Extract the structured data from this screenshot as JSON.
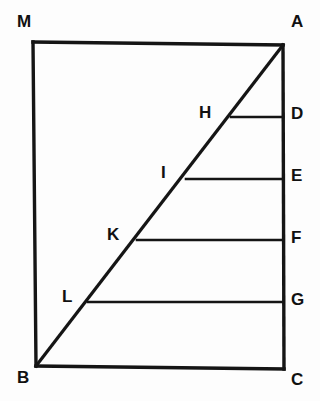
{
  "figure": {
    "name": "geometric-diagram-triangle-in-quadrilateral",
    "background_color": "#fdfdfd",
    "stroke_color": "#151515",
    "label_color": "#111111",
    "canvas": {
      "width": 320,
      "height": 401
    }
  },
  "points": {
    "M": {
      "label": "M",
      "x": 33,
      "y": 42,
      "label_x": 17,
      "label_y": 13
    },
    "A": {
      "label": "A",
      "x": 283,
      "y": 45,
      "label_x": 291,
      "label_y": 13
    },
    "B": {
      "label": "B",
      "x": 36,
      "y": 366,
      "label_x": 17,
      "label_y": 369
    },
    "C": {
      "label": "C",
      "x": 284,
      "y": 369,
      "label_x": 291,
      "label_y": 371
    },
    "D": {
      "label": "D",
      "x": 283,
      "y": 117,
      "label_x": 291,
      "label_y": 105
    },
    "E": {
      "label": "E",
      "x": 283,
      "y": 179,
      "label_x": 291,
      "label_y": 167
    },
    "F": {
      "label": "F",
      "x": 283,
      "y": 240,
      "label_x": 291,
      "label_y": 229
    },
    "G": {
      "label": "G",
      "x": 283,
      "y": 302,
      "label_x": 291,
      "label_y": 291
    },
    "H": {
      "label": "H",
      "x": 231,
      "y": 117,
      "label_x": 199,
      "label_y": 104
    },
    "I": {
      "label": "I",
      "x": 186,
      "y": 179,
      "label_x": 161,
      "label_y": 164
    },
    "K": {
      "label": "K",
      "x": 137,
      "y": 240,
      "label_x": 107,
      "label_y": 226
    },
    "L": {
      "label": "L",
      "x": 88,
      "y": 302,
      "label_x": 62,
      "label_y": 288
    }
  },
  "segments": {
    "left_side": {
      "name": "segment-MB",
      "from": "M",
      "to": "B",
      "d": "M 33 42 L 36 366"
    },
    "top_side": {
      "name": "segment-MA",
      "from": "M",
      "to": "A",
      "d": "M 33 42 L 283 45"
    },
    "right_side": {
      "name": "segment-AC",
      "from": "A",
      "to": "C",
      "d": "M 283 45 L 284 369"
    },
    "bottom_side": {
      "name": "segment-BC",
      "from": "B",
      "to": "C",
      "d": "M 36 366 L 284 369"
    },
    "diagonal": {
      "name": "segment-BA",
      "from": "B",
      "to": "A",
      "d": "M 36 366 L 283 45"
    },
    "rung_HD": {
      "name": "segment-HD",
      "from": "H",
      "to": "D",
      "d": "M 231 117 L 283 117"
    },
    "rung_IE": {
      "name": "segment-IE",
      "from": "I",
      "to": "E",
      "d": "M 186 179 L 283 179"
    },
    "rung_KF": {
      "name": "segment-KF",
      "from": "K",
      "to": "F",
      "d": "M 137 240 L 283 240"
    },
    "rung_LG": {
      "name": "segment-LG",
      "from": "L",
      "to": "G",
      "d": "M 88 302 L 283 302"
    }
  }
}
